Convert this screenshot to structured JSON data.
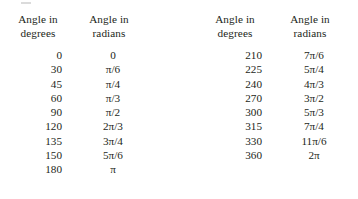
{
  "page": {
    "background_color": "#ffffff",
    "text_color": "#231f20",
    "artifact": "scan-speck"
  },
  "blocks": [
    {
      "id": "left",
      "headers": {
        "degrees": {
          "line1": "Angle in",
          "line2": "degrees"
        },
        "radians": {
          "line1": "Angle in",
          "line2": "radians"
        }
      },
      "rows": [
        {
          "degrees": "0",
          "radians": "0"
        },
        {
          "degrees": "30",
          "radians": "π/6"
        },
        {
          "degrees": "45",
          "radians": "π/4"
        },
        {
          "degrees": "60",
          "radians": "π/3"
        },
        {
          "degrees": "90",
          "radians": "π/2"
        },
        {
          "degrees": "120",
          "radians": "2π/3"
        },
        {
          "degrees": "135",
          "radians": "3π/4"
        },
        {
          "degrees": "150",
          "radians": "5π/6"
        },
        {
          "degrees": "180",
          "radians": "π"
        }
      ]
    },
    {
      "id": "right",
      "headers": {
        "degrees": {
          "line1": "Angle in",
          "line2": "degrees"
        },
        "radians": {
          "line1": "Angle in",
          "line2": "radians"
        }
      },
      "rows": [
        {
          "degrees": "210",
          "radians": "7π/6"
        },
        {
          "degrees": "225",
          "radians": "5π/4"
        },
        {
          "degrees": "240",
          "radians": "4π/3"
        },
        {
          "degrees": "270",
          "radians": "3π/2"
        },
        {
          "degrees": "300",
          "radians": "5π/3"
        },
        {
          "degrees": "315",
          "radians": "7π/4"
        },
        {
          "degrees": "330",
          "radians": "11π/6"
        },
        {
          "degrees": "360",
          "radians": "2π"
        }
      ]
    }
  ]
}
